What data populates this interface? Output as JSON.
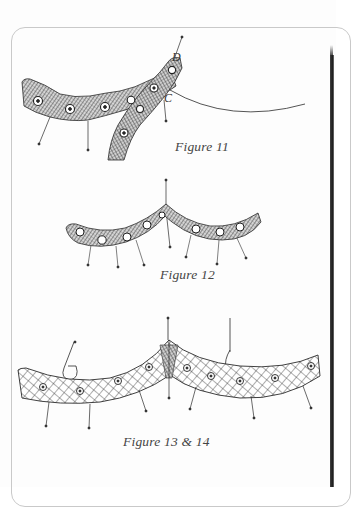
{
  "page": {
    "background": "#fdfdfd",
    "frame_color": "#c9c9c9",
    "ink_color": "#2a2a2a"
  },
  "figures": [
    {
      "id": "figure-11",
      "caption": "Figure 11",
      "point_labels": [
        "D",
        "C"
      ],
      "description": "Two crossing lace tapes with raised motifs, pinned, with a thread running from point C"
    },
    {
      "id": "figure-12",
      "caption": "Figure 12",
      "description": "Curved lace tape with dense mesh and motifs, pinned along its lower edge, peak pinned at top"
    },
    {
      "id": "figure-13-14",
      "caption": "Figure 13 & 14",
      "description": "Wide cross-hatched lace band forming two arcs meeting at a center point, with pins and spiral motifs"
    }
  ]
}
